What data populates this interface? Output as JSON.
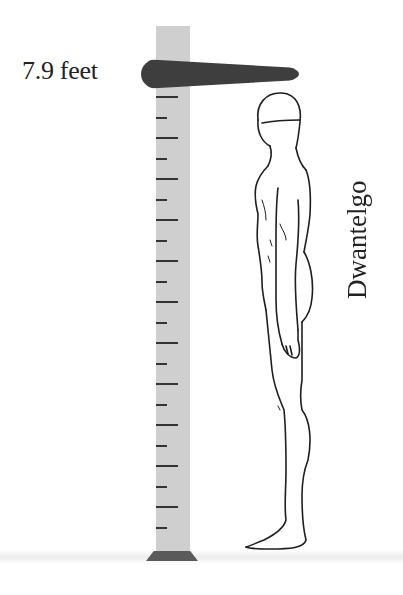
{
  "height_label": "7.9 feet",
  "character_name": "Dwantelgo",
  "ruler": {
    "tick_count": 22,
    "tick_start_y": 96,
    "tick_spacing": 20.5,
    "colors": {
      "bar": "#cfcfcf",
      "marker": "#3e3e3e",
      "ticks": "#333333"
    }
  },
  "icons": {
    "figure": "human-figure-side-view",
    "ruler": "height-ruler"
  }
}
